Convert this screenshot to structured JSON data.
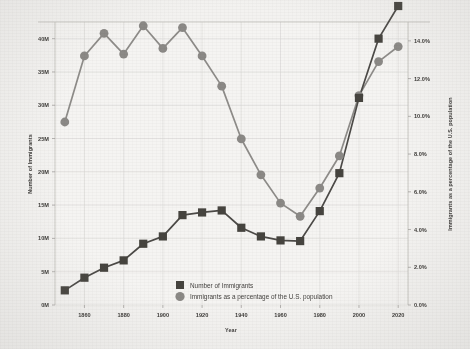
{
  "chart_data": {
    "type": "line",
    "title": "",
    "xlabel": "Year",
    "ylabel": "Number of Immigrants",
    "y2label": "Immigrants as a percentage of the U.S. population",
    "grid": true,
    "legend_position": "inside-bottom-center",
    "x": [
      1850,
      1860,
      1870,
      1880,
      1890,
      1900,
      1910,
      1920,
      1930,
      1940,
      1950,
      1960,
      1970,
      1980,
      1990,
      2000,
      2010,
      2020
    ],
    "xlim": [
      1845,
      2025
    ],
    "xticks": [
      1860,
      1880,
      1900,
      1920,
      1940,
      1960,
      1980,
      2000,
      2020
    ],
    "xtick_labels": [
      "1860",
      "1880",
      "1900",
      "1920",
      "1940",
      "1960",
      "1980",
      "2000",
      "2020"
    ],
    "ylim": [
      0,
      42.5
    ],
    "yticks": [
      0,
      5,
      10,
      15,
      20,
      25,
      30,
      35,
      40
    ],
    "ytick_labels": [
      "0M",
      "5M",
      "10M",
      "15M",
      "20M",
      "25M",
      "30M",
      "35M",
      "40M"
    ],
    "y2lim": [
      0,
      15.0
    ],
    "y2ticks": [
      0,
      2,
      4,
      6,
      8,
      10,
      12,
      14
    ],
    "y2tick_labels": [
      "0.0%",
      "2.0%",
      "4.0%",
      "6.0%",
      "8.0%",
      "10.0%",
      "12.0%",
      "14.0%"
    ],
    "series": [
      {
        "name": "Number of Immigrants",
        "marker": "square",
        "color": "#46443f",
        "axis": "left",
        "unit": "millions",
        "values": [
          2.2,
          4.1,
          5.6,
          6.7,
          9.2,
          10.3,
          13.5,
          13.9,
          14.2,
          11.6,
          10.3,
          9.7,
          9.6,
          14.1,
          19.8,
          31.1,
          40.0,
          44.9
        ]
      },
      {
        "name": "Immigrants as a percentage of the U.S. population",
        "marker": "circle",
        "color": "#8b8986",
        "axis": "right",
        "unit": "percent",
        "values": [
          9.7,
          13.2,
          14.4,
          13.3,
          14.8,
          13.6,
          14.7,
          13.2,
          11.6,
          8.8,
          6.9,
          5.4,
          4.7,
          6.2,
          7.9,
          11.1,
          12.9,
          13.7
        ]
      }
    ]
  },
  "legend": {
    "items": [
      {
        "label": "Number of Immigrants",
        "marker": "square",
        "color": "#46443f"
      },
      {
        "label": "Immigrants as a percentage of the U.S. population",
        "marker": "circle",
        "color": "#8b8986"
      }
    ]
  },
  "axes": {
    "x_title": "Year",
    "y_left_title": "Number of Immigrants",
    "y_right_title": "Immigrants as a percentage of the U.S. population"
  }
}
